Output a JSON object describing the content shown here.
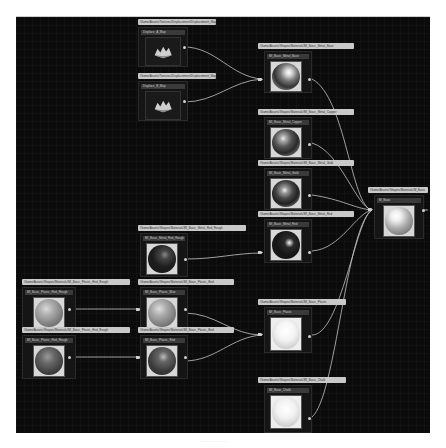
{
  "editor": {
    "canvas_background": "#0b0b0b",
    "wire_color": "#d8d8d8"
  },
  "nodes": {
    "texture_a": {
      "path": "/Game/Assets/Textures/Displacement/Displacement_Map",
      "title": "Displace_A_Map",
      "icon": "texture-landscape-icon"
    },
    "texture_b": {
      "path": "/Game/Assets/Textures/Displacement/Displacement_Map",
      "title": "Displace_B_Map",
      "icon": "texture-landscape-icon"
    },
    "metal_base": {
      "path": "/Game/Assets/Shapes/Materials/MI_Basic_Metal_Base",
      "title": "MI_Basic_Metal_Base",
      "tone": "chrome"
    },
    "metal_copper": {
      "path": "/Game/Assets/Shapes/Materials/MI_Basic_Metal_Copper",
      "title": "MI_Basic_Metal_Copper",
      "tone": "chrome"
    },
    "metal_gold": {
      "path": "/Game/Assets/Shapes/Materials/MI_Basic_Metal_Gold",
      "title": "MI_Basic_Metal_Gold",
      "tone": "chrome"
    },
    "metal_red_rough_mid": {
      "path": "/Game/Assets/Shapes/Materials/MI_Basic_Metal_Red_Rough",
      "title": "MI_Basic_Metal_Red_Rough",
      "tone": "dark"
    },
    "metal_red": {
      "path": "/Game/Assets/Shapes/Materials/MI_Basic_Metal_Red",
      "title": "MI_Basic_Metal_Red",
      "tone": "dark-glossy"
    },
    "plastic_red_rough_a": {
      "path": "/Game/Assets/Shapes/Materials/MI_Basic_Plastic_Red_Rough",
      "title": "MI_Basic_Plastic_Red_Rough",
      "tone": "matte-light"
    },
    "plastic_red_rough_b": {
      "path": "/Game/Assets/Shapes/Materials/MI_Basic_Plastic_Red_Rough",
      "title": "MI_Basic_Plastic_Red_Rough",
      "tone": "matte-mid"
    },
    "plastic_blue": {
      "path": "/Game/Assets/Shapes/Materials/MI_Basic_Plastic_Red",
      "title": "MI_Basic_Plastic_Blue",
      "tone": "matte-light"
    },
    "plastic_red": {
      "path": "/Game/Assets/Shapes/Materials/MI_Basic_Plastic_Red",
      "title": "MI_Basic_Plastic_Red",
      "tone": "matte-mid"
    },
    "plastic": {
      "path": "/Game/Assets/Shapes/Materials/MI_Basic_Plastic",
      "title": "MI_Basic_Plastic",
      "tone": "white"
    },
    "chalk": {
      "path": "/Game/Assets/Shapes/Materials/MI_Basic_Chalk",
      "title": "MI_Basic_Chalk",
      "tone": "white"
    },
    "output": {
      "path": "/Game/Assets/Shapes/Materials/M_Basic",
      "title": "M_Basic",
      "tone": "chrome-light"
    }
  },
  "footer": {
    "text": "· · · · · · · · · · · · · · · ·"
  }
}
